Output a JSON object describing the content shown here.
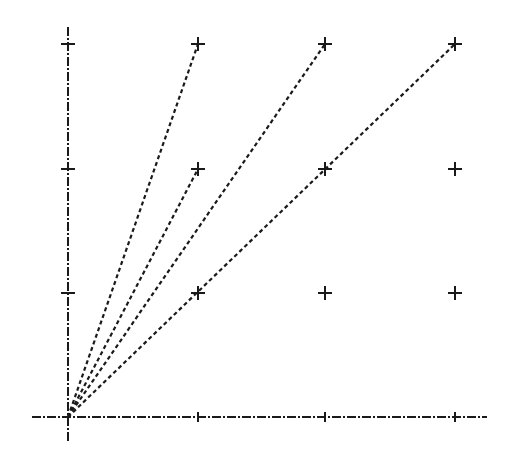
{
  "diagram": {
    "type": "lattice-rays",
    "background": "#ffffff",
    "ink": "#1a1a1a",
    "origin": {
      "x": 68,
      "y": 417
    },
    "axes": {
      "x_axis": {
        "from": [
          32,
          417
        ],
        "to": [
          487,
          417
        ],
        "style": "dash-dot",
        "ticks_x": [
          198,
          325,
          455
        ]
      },
      "y_axis": {
        "from": [
          68,
          27
        ],
        "to": [
          68,
          443
        ],
        "style": "dash-dot",
        "ticks_y": [
          293,
          169,
          44
        ]
      }
    },
    "grid_points": [
      {
        "col": 1,
        "row": 1,
        "x": 198,
        "y": 293
      },
      {
        "col": 2,
        "row": 1,
        "x": 325,
        "y": 293
      },
      {
        "col": 3,
        "row": 1,
        "x": 455,
        "y": 293
      },
      {
        "col": 1,
        "row": 2,
        "x": 198,
        "y": 169
      },
      {
        "col": 2,
        "row": 2,
        "x": 325,
        "y": 169
      },
      {
        "col": 3,
        "row": 2,
        "x": 455,
        "y": 169
      },
      {
        "col": 1,
        "row": 3,
        "x": 198,
        "y": 44
      },
      {
        "col": 2,
        "row": 3,
        "x": 325,
        "y": 44
      },
      {
        "col": 3,
        "row": 3,
        "x": 455,
        "y": 44
      }
    ],
    "rays": [
      {
        "to_col": 1,
        "to_row": 3,
        "x": 198,
        "y": 44
      },
      {
        "to_col": 1,
        "to_row": 2,
        "x": 198,
        "y": 169
      },
      {
        "to_col": 2,
        "to_row": 3,
        "x": 325,
        "y": 44
      },
      {
        "to_col": 3,
        "to_row": 3,
        "x": 455,
        "y": 44
      }
    ]
  }
}
